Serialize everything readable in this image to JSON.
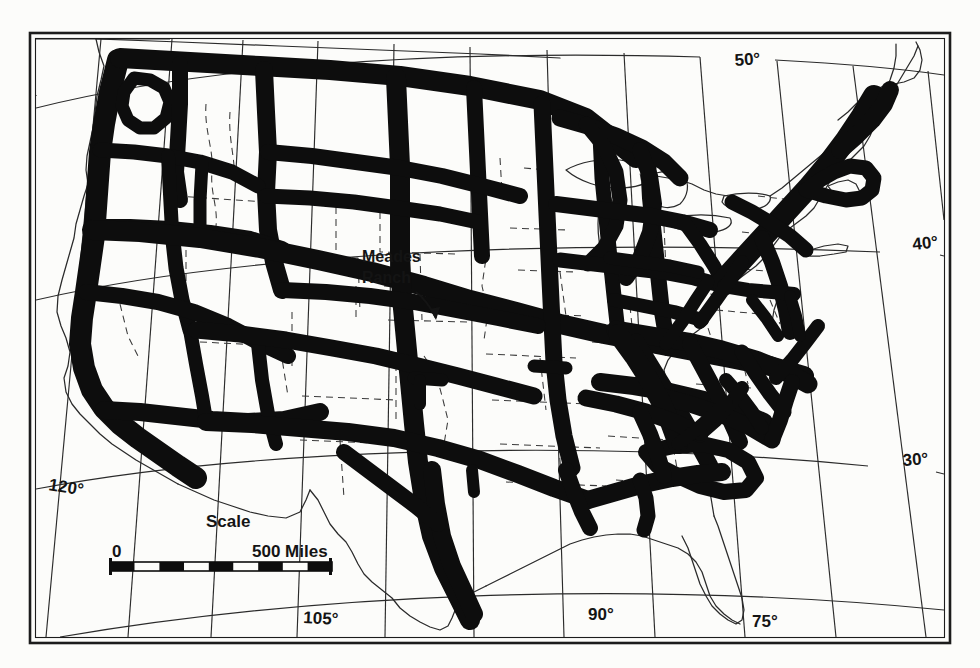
{
  "figure": {
    "kind": "scanned-map",
    "background_color": "#fcfcfa",
    "ink_color": "#0d0d0d",
    "line_color": "#1a1a1a"
  },
  "frame": {
    "outer": {
      "x": 30,
      "y": 33,
      "width": 920,
      "height": 610
    },
    "inner_inset": 5,
    "stroke_outer": 2.5,
    "stroke_inner": 1.2
  },
  "labels": {
    "place_annotation": {
      "name": "Meades Ranch",
      "line1": "Meades",
      "line2": "Ranch",
      "x": 362,
      "y": 262,
      "font_size": 16,
      "has_leader_arrow": true
    },
    "graticule": [
      {
        "text": "50°",
        "x": 735,
        "y": 66,
        "rotate": -4,
        "name": "latitude-50"
      },
      {
        "text": "40°",
        "x": 915,
        "y": 248,
        "rotate": -6,
        "name": "latitude-40"
      },
      {
        "text": "30°",
        "x": 905,
        "y": 465,
        "rotate": -4,
        "name": "latitude-30"
      },
      {
        "text": "120°",
        "x": 52,
        "y": 487,
        "rotate": 9,
        "name": "longitude-120"
      },
      {
        "text": "105°",
        "x": 310,
        "y": 622,
        "rotate": 3,
        "name": "longitude-105"
      },
      {
        "text": "90°",
        "x": 593,
        "y": 618,
        "rotate": 0,
        "name": "longitude-90"
      },
      {
        "text": "75°",
        "x": 757,
        "y": 625,
        "rotate": 0,
        "name": "longitude-75"
      }
    ]
  },
  "scale_bar": {
    "title": "Scale",
    "title_x": 206,
    "title_y": 527,
    "left_label": "0",
    "left_label_x": 112,
    "left_label_y": 556,
    "right_label": "500 Miles",
    "right_label_x": 255,
    "right_label_y": 556,
    "bar": {
      "x": 110,
      "y": 562,
      "width": 222,
      "height": 9
    },
    "segments": 9,
    "units": "Miles",
    "max_value": 500,
    "min_value": 0,
    "font_size": 17
  },
  "map_data": {
    "projection_hint": "conic",
    "parallels_drawn": [
      50,
      40,
      30
    ],
    "meridians_drawn": [
      120,
      105,
      90,
      75
    ],
    "datum_origin": "Meades Ranch",
    "network_description": "Thick black bands represent arcs of triangulation forming a continental net; thin solid lines are coastlines and international boundaries; dashed lines are state boundaries."
  }
}
